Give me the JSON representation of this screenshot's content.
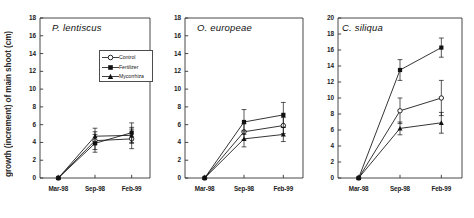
{
  "figure": {
    "ylabel": "growth (increment) of main shoot (cm)",
    "legend": {
      "items": [
        {
          "label": "Control",
          "marker": "open-circle"
        },
        {
          "label": "Fertilizer",
          "marker": "filled-square"
        },
        {
          "label": "Mycorrhiza",
          "marker": "filled-triangle"
        }
      ]
    }
  },
  "chart_data": [
    {
      "type": "line",
      "title": "P. lentiscus",
      "xlabel": "",
      "ylabel": "growth (increment) of main shoot (cm)",
      "categories": [
        "Mar-98",
        "Sep-98",
        "Feb-99"
      ],
      "ylim": [
        0,
        18
      ],
      "yticks": [
        0,
        2,
        4,
        6,
        8,
        10,
        12,
        14,
        16,
        18
      ],
      "grid": false,
      "legend_position": "upper-right",
      "series": [
        {
          "name": "Control",
          "marker": "open-circle",
          "values": [
            0,
            4.2,
            4.4
          ],
          "errors": [
            0,
            1.0,
            1.1
          ]
        },
        {
          "name": "Fertilizer",
          "marker": "filled-square",
          "values": [
            0,
            3.9,
            5.1
          ],
          "errors": [
            0,
            1.0,
            1.1
          ]
        },
        {
          "name": "Mycorrhiza",
          "marker": "filled-triangle",
          "values": [
            0,
            4.7,
            4.8
          ],
          "errors": [
            0,
            0.9,
            0.9
          ]
        }
      ]
    },
    {
      "type": "line",
      "title": "O. europeae",
      "xlabel": "",
      "ylabel": "",
      "categories": [
        "Mar-98",
        "Sep-98",
        "Feb-99"
      ],
      "ylim": [
        0,
        18
      ],
      "yticks": [
        0,
        2,
        4,
        6,
        8,
        10,
        12,
        14,
        16,
        18
      ],
      "grid": false,
      "legend_position": "none",
      "series": [
        {
          "name": "Control",
          "marker": "open-circle",
          "values": [
            0,
            5.2,
            5.9
          ],
          "errors": [
            0,
            0.9,
            0.9
          ]
        },
        {
          "name": "Fertilizer",
          "marker": "filled-square",
          "values": [
            0,
            6.3,
            7.1
          ],
          "errors": [
            0,
            1.4,
            1.4
          ]
        },
        {
          "name": "Mycorrhiza",
          "marker": "filled-triangle",
          "values": [
            0,
            4.4,
            4.9
          ],
          "errors": [
            0,
            0.9,
            0.8
          ]
        }
      ]
    },
    {
      "type": "line",
      "title": "C. siliqua",
      "xlabel": "",
      "ylabel": "",
      "categories": [
        "Mar-98",
        "Sep-98",
        "Feb-99"
      ],
      "ylim": [
        0,
        20
      ],
      "yticks": [
        0,
        2,
        4,
        6,
        8,
        10,
        12,
        14,
        16,
        18,
        20
      ],
      "grid": false,
      "legend_position": "none",
      "series": [
        {
          "name": "Control",
          "marker": "open-circle",
          "values": [
            0,
            8.4,
            10.0
          ],
          "errors": [
            0,
            1.6,
            2.2
          ]
        },
        {
          "name": "Fertilizer",
          "marker": "filled-square",
          "values": [
            0,
            13.5,
            16.3
          ],
          "errors": [
            0,
            1.3,
            1.2
          ]
        },
        {
          "name": "Mycorrhiza",
          "marker": "filled-triangle",
          "values": [
            0,
            6.2,
            6.9
          ],
          "errors": [
            0,
            0.8,
            1.3
          ]
        }
      ]
    }
  ]
}
